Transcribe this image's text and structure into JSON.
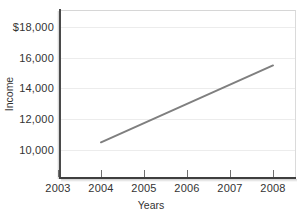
{
  "chart_data": {
    "type": "line",
    "title": "",
    "xlabel": "Years",
    "ylabel": "Income",
    "x": [
      2004,
      2008
    ],
    "values": [
      10500,
      15500
    ],
    "series": [
      {
        "name": "Income",
        "x": [
          2004,
          2008
        ],
        "values": [
          10500,
          15500
        ]
      }
    ],
    "xlim": [
      2003,
      2008
    ],
    "ylim": [
      9000,
      18700
    ],
    "xticks": [
      "2003",
      "2004",
      "2005",
      "2006",
      "2007",
      "2008"
    ],
    "xtick_values": [
      2003,
      2004,
      2005,
      2006,
      2007,
      2008
    ],
    "yticks": [
      "10,000",
      "12,000",
      "14,000",
      "16,000",
      "$18,000"
    ],
    "ytick_values": [
      10000,
      12000,
      14000,
      16000,
      18000
    ],
    "grid": "horizontal",
    "legend": "none",
    "line_color": "#7f7f7f",
    "grid_color": "#ececec",
    "axis_color": "#434343"
  },
  "axes": {
    "y_title": "Income",
    "x_title": "Years",
    "y_tick_labels": [
      "$18,000",
      "16,000",
      "14,000",
      "12,000",
      "10,000"
    ],
    "x_tick_labels": [
      "2003",
      "2004",
      "2005",
      "2006",
      "2007",
      "2008"
    ]
  }
}
